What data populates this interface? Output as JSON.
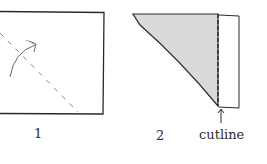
{
  "figure": {
    "steps": [
      {
        "number": "1",
        "description": "square sheet with diagonal dashed fold line and curved arrow"
      },
      {
        "number": "2",
        "description": "folded triangle with strip beyond cut line"
      }
    ],
    "annotation": "cutline",
    "colors": {
      "stroke": "#2a2a2a",
      "fold_dash": "#8a8a8a",
      "shaded": "#d9d9d9"
    }
  }
}
